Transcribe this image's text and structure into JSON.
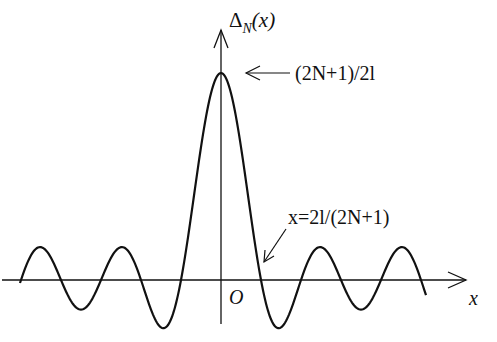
{
  "diagram": {
    "y_axis_label": {
      "main": "Δ",
      "sub": "N",
      "arg": "(x)"
    },
    "x_axis_label": "x",
    "origin_label": "O",
    "peak_annotation": "(2N+1)/2l",
    "zero_annotation": "x=2l/(2N+1)",
    "colors": {
      "line": "#111111",
      "background": "#ffffff"
    }
  }
}
